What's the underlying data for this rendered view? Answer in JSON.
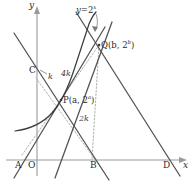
{
  "figure": {
    "type": "geometry-diagram",
    "colors": {
      "axis": "#9a9a9a",
      "solid_line": "#555555",
      "curve": "#3c3c3c",
      "dotted_line": "#aaaaaa",
      "text": "#2a2a2a"
    }
  },
  "axes": {
    "y_label": "y",
    "x_label": "x",
    "origin_label": "O"
  },
  "curve": {
    "label_y": "y",
    "label_eq": "=2",
    "label_exp": "x",
    "full_label": "y=2^x"
  },
  "points": [
    {
      "name": "A",
      "label": "A"
    },
    {
      "name": "B",
      "label": "B"
    },
    {
      "name": "C",
      "label": "C"
    },
    {
      "name": "D",
      "label": "D"
    },
    {
      "name": "P",
      "label": "P(a, 2",
      "exp": "a",
      "close": ")"
    },
    {
      "name": "Q",
      "label": "Q(b, 2",
      "exp": "b",
      "close": ")"
    }
  ],
  "slopes": [
    {
      "name": "k",
      "label": "k"
    },
    {
      "name": "2k",
      "label": "2k"
    },
    {
      "name": "4k",
      "label": "4k"
    }
  ]
}
